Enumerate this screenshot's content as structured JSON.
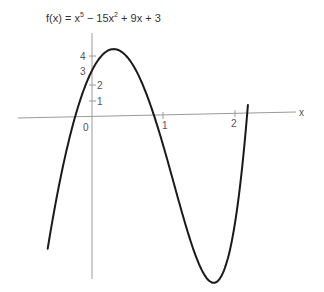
{
  "chart_data": {
    "type": "line",
    "title_parts": {
      "prefix": "f(x) = x",
      "exp1": "5",
      "mid": " − 15x",
      "exp2": "2",
      "suffix": " + 9x + 3"
    },
    "xlabel": "x",
    "ylabel": "",
    "x_ticks": [
      "0",
      "1",
      "2"
    ],
    "y_ticks": [
      "1",
      "2",
      "3",
      "4"
    ],
    "xlim": [
      -0.62,
      2.18
    ],
    "ylim": [
      -10.5,
      4.35
    ],
    "grid": false,
    "series": [
      {
        "name": "f(x)",
        "function": "x^5 - 15x^2 + 9x + 3",
        "x": [
          -0.62,
          -0.5,
          -0.3,
          -0.2,
          0,
          0.15,
          0.3,
          0.5,
          0.7,
          0.85,
          1.0,
          1.2,
          1.4,
          1.6,
          1.7,
          1.8,
          1.9,
          2.0,
          2.1,
          2.18
        ],
        "y": [
          -8.4,
          -5.3,
          -1.0,
          0.6,
          3.0,
          4.0,
          4.35,
          3.28,
          0.5,
          -1.86,
          -2.0,
          -6.1,
          -7.9,
          -10.5,
          -9.9,
          -8.5,
          -5.5,
          -1.0,
          4.7,
          0.5
        ]
      }
    ],
    "color": "#1a1a1a"
  }
}
